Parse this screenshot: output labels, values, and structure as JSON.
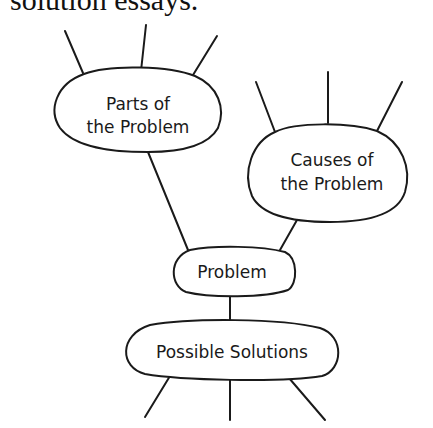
{
  "header": {
    "text": "solution essays."
  },
  "diagram": {
    "nodes": {
      "parts": {
        "line1": "Parts of",
        "line2": "the Problem"
      },
      "causes": {
        "line1": "Causes of",
        "line2": "the Problem"
      },
      "problem": {
        "label": "Problem"
      },
      "solutions": {
        "label": "Possible Solutions"
      }
    },
    "stroke_color": "#1a1a1a",
    "background": "#ffffff"
  }
}
